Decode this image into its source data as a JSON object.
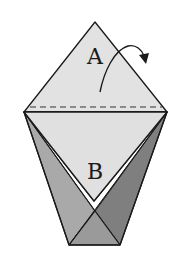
{
  "diagram": {
    "type": "origami-fold-step",
    "labels": {
      "top_flap": "A",
      "lower_panel": "B"
    },
    "colors": {
      "light_paper": "#e2e2e2",
      "left_flap": "#a9a9a9",
      "right_flap": "#7f7f7f",
      "bottom_flap": "#9a9a9a",
      "outline": "#1a1a1a"
    },
    "annotations": {
      "fold_line": "dashed valley fold line across top of lower panel",
      "arrow": "curved arrow indicating flap A folds back (behind)"
    }
  }
}
